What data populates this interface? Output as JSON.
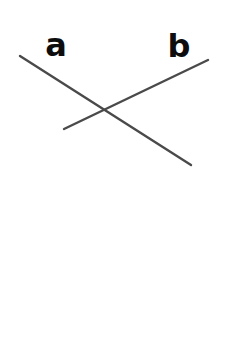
{
  "diagram": {
    "width": 232,
    "height": 340,
    "background": "#ffffff",
    "line_color": "#4a4a4a",
    "label_color": "#0d0d0d",
    "line_width": 2.4,
    "lines": [
      {
        "id": "a",
        "label": "a",
        "x1": 20,
        "y1": 56,
        "x2": 191,
        "y2": 165,
        "label_x": 56,
        "label_y": 56
      },
      {
        "id": "b",
        "label": "b",
        "x1": 64,
        "y1": 129,
        "x2": 208,
        "y2": 60,
        "label_x": 179,
        "label_y": 57
      }
    ],
    "intersection": {
      "x": 104,
      "y": 110
    }
  }
}
